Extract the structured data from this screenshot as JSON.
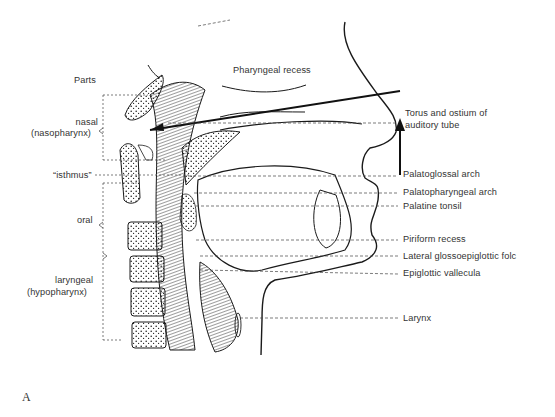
{
  "figure": {
    "panel_letter": "A",
    "parts_heading": "Parts",
    "parts": [
      {
        "id": "nasal",
        "line1": "nasal",
        "line2": "(nasopharynx)"
      },
      {
        "id": "isthmus",
        "line1": "“isthmus”"
      },
      {
        "id": "oral",
        "line1": "oral"
      },
      {
        "id": "laryngeal",
        "line1": "laryngeal",
        "line2": "(hypopharynx)"
      }
    ],
    "labels_top": [
      {
        "id": "pharyngeal-recess",
        "text": "Pharyngeal recess"
      }
    ],
    "labels_right": [
      {
        "id": "torus-ostium",
        "line1": "Torus and ostium of",
        "line2": "auditory tube"
      },
      {
        "id": "palatoglossal-arch",
        "text": "Palatoglossal arch"
      },
      {
        "id": "palatopharyngeal-arch",
        "text": "Palatopharyngeal arch"
      },
      {
        "id": "palatine-tonsil",
        "text": "Palatine tonsil"
      },
      {
        "id": "piriform-recess",
        "text": "Piriform recess"
      },
      {
        "id": "lateral-glossoepiglottic-fold",
        "text": "Lateral glossoepiglottic folc"
      },
      {
        "id": "epiglottic-vallecula",
        "text": "Epiglottic vallecula"
      },
      {
        "id": "larynx",
        "text": "Larynx"
      }
    ],
    "colors": {
      "ink": "#1a1a1a",
      "label": "#333333",
      "background": "#ffffff"
    }
  }
}
